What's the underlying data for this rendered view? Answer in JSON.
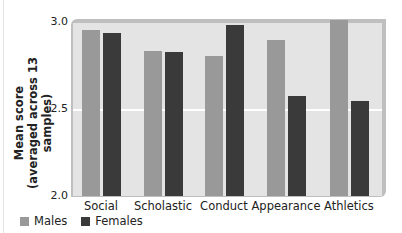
{
  "chart_data": {
    "type": "bar",
    "title": "",
    "xlabel": "",
    "ylabel": "Mean score (averaged across 13 samples)",
    "ylabel_line1": "Mean score",
    "ylabel_line2": "(averaged across 13 samples)",
    "ylim": [
      2.0,
      3.0
    ],
    "yticks": [
      "2.0",
      "2.5",
      "3.0"
    ],
    "categories": [
      "Social",
      "Scholastic",
      "Conduct",
      "Appearance",
      "Athletics"
    ],
    "series": [
      {
        "name": "Males",
        "color": "#999999",
        "values": [
          2.96,
          2.84,
          2.81,
          2.9,
          3.02
        ]
      },
      {
        "name": "Females",
        "color": "#3a3a3a",
        "values": [
          2.94,
          2.83,
          2.99,
          2.58,
          2.55
        ]
      }
    ],
    "grid": "horizontal white line at 2.5",
    "legend_position": "bottom-left"
  },
  "legend": {
    "males": "Males",
    "females": "Females"
  }
}
